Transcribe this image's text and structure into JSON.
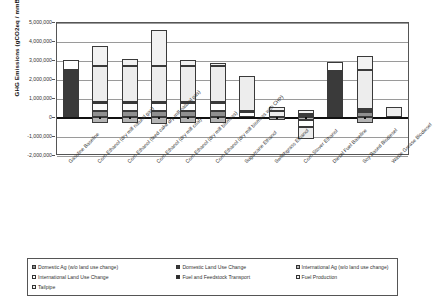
{
  "chart_data": {
    "type": "bar",
    "subtype": "stacked-bar",
    "title": "",
    "xlabel": "",
    "ylabel": "GHG Emissions (gCO2eq / mmBtu)",
    "ylim": [
      -2000000,
      5000000
    ],
    "ytick_labels": [
      "5,000,000",
      "4,000,000",
      "3,000,000",
      "2,000,000",
      "1,000,000",
      "0",
      "-1,000,000",
      "-2,000,000"
    ],
    "ytick_values": [
      5000000,
      4000000,
      3000000,
      2000000,
      1000000,
      0,
      -1000000,
      -2000000
    ],
    "grid": true,
    "legend_position": "bottom",
    "categories": [
      "Gasoline Baseline",
      "Corn Ethanol (dry mill natural gas)",
      "Corn Ethanol (feed cake dry mill natural gas)",
      "Corn Ethanol (dry mill coal)",
      "Corn Ethanol (dry mill biomass)",
      "Corn Ethanol (dry mill biomass with CHP)",
      "Sugarcane Ethanol",
      "Switchgrass Ethanol",
      "Corn Stover Ethanol",
      "Diesel Fuel Baseline",
      "Soy Based Biodiesel",
      "Waste Grease Biodiesel"
    ],
    "series": [
      {
        "name": "Domestic Ag (w/o land use change)",
        "color": "#8f8f8f",
        "values": [
          0,
          300000,
          300000,
          300000,
          300000,
          300000,
          0,
          0,
          120000,
          0,
          250000,
          0
        ]
      },
      {
        "name": "Domestic Land Use Change",
        "color": "#3a3a3a",
        "values": [
          2450000,
          0,
          0,
          0,
          0,
          0,
          0,
          0,
          0,
          2400000,
          0,
          0
        ]
      },
      {
        "name": "International Ag (w/o land use change)",
        "color": "#b4b4b4",
        "values": [
          0,
          -300000,
          -310000,
          -350000,
          -300000,
          -320000,
          0,
          -180000,
          -180000,
          0,
          -290000,
          0
        ]
      },
      {
        "name": "International Land Use Change",
        "color": "#ffffff",
        "values": [
          550000,
          420000,
          420000,
          430000,
          430000,
          420000,
          260000,
          0,
          -350000,
          480000,
          130000,
          0
        ]
      },
      {
        "name": "Fuel and Feedstock Transport",
        "color": "#2b2b2b",
        "values": [
          0,
          80000,
          70000,
          80000,
          70000,
          60000,
          40000,
          0,
          60000,
          0,
          60000,
          0
        ]
      },
      {
        "name": "Fuel Production",
        "color": "#ededed",
        "values": [
          0,
          1880000,
          1880000,
          1880000,
          1880000,
          1920000,
          1850000,
          320000,
          -620000,
          0,
          2050000,
          520000
        ]
      },
      {
        "name": "Tailpipe",
        "color": "#f2f2f2",
        "values": [
          0,
          1050000,
          370000,
          1870000,
          340000,
          140000,
          0,
          200000,
          200000,
          0,
          700000,
          0
        ]
      }
    ],
    "bar_totals": [
      3000000,
      3440000,
      2770000,
      4260000,
      2740000,
      2520000,
      2150000,
      520000,
      200000,
      2880000,
      3310000,
      540000
    ]
  },
  "legend": {
    "items": [
      {
        "label": "Domestic Ag (w/o land use change)",
        "swatch": "s-domag"
      },
      {
        "label": "Domestic Land Use Change",
        "swatch": "s-domluc"
      },
      {
        "label": "International Ag (w/o land use change)",
        "swatch": "s-intag"
      },
      {
        "label": "International Land Use Change",
        "swatch": "s-intluc"
      },
      {
        "label": "Fuel and Feedstock Transport",
        "swatch": "s-transport"
      },
      {
        "label": "Fuel Production",
        "swatch": "s-fuelprod"
      },
      {
        "label": "Tailpipe",
        "swatch": "s-tailpipe"
      }
    ]
  }
}
